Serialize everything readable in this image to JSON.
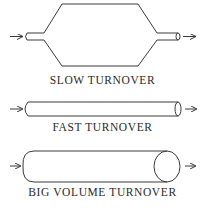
{
  "diagram": {
    "panels": [
      {
        "id": "slow",
        "label": "SLOW TURNOVER",
        "shape": "hexagonal-reservoir-with-narrow-inlet-outlet"
      },
      {
        "id": "fast",
        "label": "FAST TURNOVER",
        "shape": "long-thin-tube"
      },
      {
        "id": "big",
        "label": "BIG VOLUME TURNOVER",
        "shape": "long-wide-cylinder"
      }
    ],
    "colors": {
      "stroke": "#3a3a3a",
      "background": "#ffffff",
      "text": "#2a2a2a"
    }
  }
}
